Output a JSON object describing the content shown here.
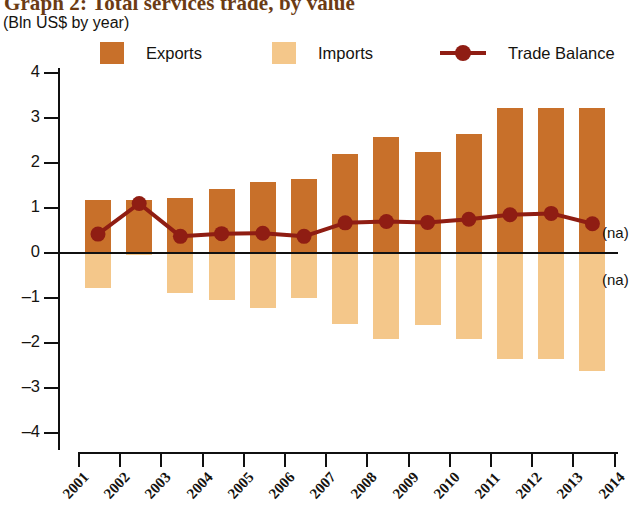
{
  "chart_data": {
    "type": "bar",
    "title": "Graph 2: Total services trade, by value",
    "subtitle": "(Bln US$ by year)",
    "xlabel": "",
    "ylabel": "",
    "ylim": [
      -4,
      4
    ],
    "yticks": [
      "4",
      "3",
      "2",
      "1",
      "0",
      "–1",
      "–2",
      "–3",
      "–4"
    ],
    "ytick_values": [
      4,
      3,
      2,
      1,
      0,
      -1,
      -2,
      -3,
      -4
    ],
    "grid": false,
    "legend_position": "top",
    "categories": [
      "2001",
      "2002",
      "2003",
      "2004",
      "2005",
      "2006",
      "2007",
      "2008",
      "2009",
      "2010",
      "2011",
      "2012",
      "2013"
    ],
    "xtick_labels": [
      "2001",
      "2002",
      "2003",
      "2004",
      "2005",
      "2006",
      "2007",
      "2008",
      "2009",
      "2010",
      "2011",
      "2012",
      "2013",
      "2014"
    ],
    "series": [
      {
        "name": "Exports",
        "type": "bar",
        "color": "#c8702a",
        "values": [
          1.17,
          1.17,
          1.22,
          1.42,
          1.58,
          1.65,
          2.2,
          2.58,
          2.25,
          2.65,
          3.22,
          3.22,
          3.22
        ]
      },
      {
        "name": "Imports",
        "type": "bar",
        "color": "#f4c78a",
        "values": [
          -0.78,
          -0.05,
          -0.88,
          -1.05,
          -1.22,
          -1.0,
          -1.58,
          -1.92,
          -1.6,
          -1.92,
          -2.35,
          -2.35,
          -2.62
        ]
      },
      {
        "name": "Trade Balance",
        "type": "line",
        "color": "#8f1d13",
        "values": [
          0.42,
          1.1,
          0.37,
          0.43,
          0.44,
          0.37,
          0.67,
          0.7,
          0.68,
          0.75,
          0.85,
          0.88,
          0.65
        ]
      }
    ],
    "annotations": [
      {
        "text": "(na)",
        "x": 2014,
        "y": 0.45
      },
      {
        "text": "(na)",
        "x": 2014,
        "y": -0.6
      }
    ]
  },
  "legend": {
    "exports_label": "Exports",
    "imports_label": "Imports",
    "balance_label": "Trade Balance"
  },
  "colors": {
    "exports": "#c8702a",
    "imports": "#f4c78a",
    "balance": "#8f1d13",
    "title": "#6b3b14",
    "axis": "#101010"
  }
}
